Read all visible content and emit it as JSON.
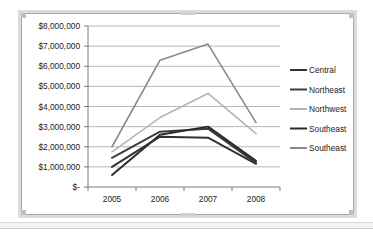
{
  "chart_data": {
    "type": "line",
    "title": "",
    "xlabel": "",
    "ylabel": "",
    "x": [
      "2005",
      "2006",
      "2007",
      "2008"
    ],
    "categories": [
      "2005",
      "2006",
      "2007",
      "2008"
    ],
    "ylim": [
      0,
      8000000
    ],
    "ytick_step": 1000000,
    "ytick_labels": [
      "$8,000,000",
      "$7,000,000",
      "$6,000,000",
      "$5,000,000",
      "$4,000,000",
      "$3,000,000",
      "$2,000,000",
      "$1,000,000",
      "$-"
    ],
    "ytick_values": [
      8000000,
      7000000,
      6000000,
      5000000,
      4000000,
      3000000,
      2000000,
      1000000,
      0
    ],
    "xtick_labels": [
      "2005",
      "2006",
      "2007",
      "2008"
    ],
    "grid": true,
    "grid_axis": "y",
    "legend_position": "right",
    "series": [
      {
        "name": "Central",
        "color": "#333333",
        "width": 2.0,
        "values": [
          1000000,
          2500000,
          2450000,
          1150000
        ]
      },
      {
        "name": "Northeast",
        "color": "#3d3d3d",
        "width": 2.0,
        "values": [
          1450000,
          2750000,
          2900000,
          1200000
        ]
      },
      {
        "name": "Northwest",
        "color": "#b5b5b5",
        "width": 1.6,
        "values": [
          1750000,
          3450000,
          4650000,
          2650000
        ]
      },
      {
        "name": "Southeast",
        "color": "#2b2b2b",
        "width": 2.0,
        "values": [
          600000,
          2600000,
          3000000,
          1300000
        ]
      },
      {
        "name": "Southeast",
        "color": "#8a8a8a",
        "width": 1.6,
        "values": [
          2000000,
          6300000,
          7100000,
          3200000
        ]
      }
    ]
  },
  "legend": {
    "entries": [
      {
        "label": "Central"
      },
      {
        "label": "Northeast"
      },
      {
        "label": "Northwest"
      },
      {
        "label": "Southeast"
      },
      {
        "label": "Southeast"
      }
    ]
  },
  "colors": {
    "gridline": "#9a9a9a",
    "axis": "#6e6e6e",
    "frame": "#dcdcdc",
    "plot_background": "#ffffff",
    "text": "#1a1a1a"
  }
}
